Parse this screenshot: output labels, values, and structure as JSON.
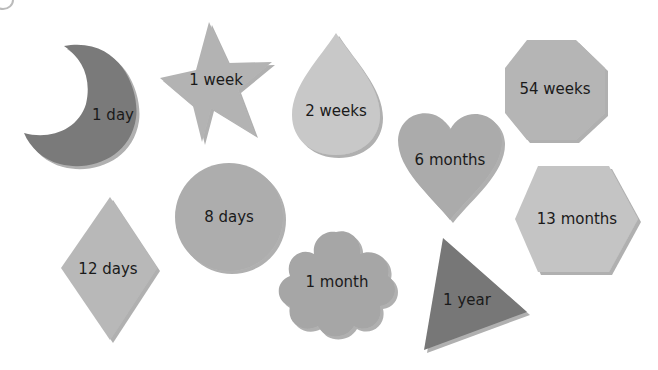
{
  "shapes": [
    {
      "id": "moon",
      "label": "1 day",
      "color": "#7a7a7a"
    },
    {
      "id": "star",
      "label": "1 week",
      "color": "#b3b3b3"
    },
    {
      "id": "drop",
      "label": "2 weeks",
      "color": "#c8c8c8"
    },
    {
      "id": "octagon",
      "label": "54 weeks",
      "color": "#b5b5b5"
    },
    {
      "id": "heart",
      "label": "6 months",
      "color": "#ababab"
    },
    {
      "id": "hexagon",
      "label": "13 months",
      "color": "#c4c4c4"
    },
    {
      "id": "diamond",
      "label": "12 days",
      "color": "#b8b8b8"
    },
    {
      "id": "circle",
      "label": "8 days",
      "color": "#adadad"
    },
    {
      "id": "flower",
      "label": "1 month",
      "color": "#a6a6a6"
    },
    {
      "id": "triangle",
      "label": "1 year",
      "color": "#777777"
    }
  ]
}
